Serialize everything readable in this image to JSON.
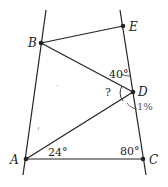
{
  "diagram": {
    "type": "geometry",
    "points": [
      {
        "name": "A",
        "x": 26,
        "y": 159
      },
      {
        "name": "B",
        "x": 41,
        "y": 43
      },
      {
        "name": "C",
        "x": 143,
        "y": 159
      },
      {
        "name": "D",
        "x": 133,
        "y": 92
      },
      {
        "name": "E",
        "x": 123,
        "y": 26
      }
    ],
    "lines": [
      {
        "name": "left-line",
        "from": [
          46,
          10
        ],
        "to": [
          23,
          175
        ]
      },
      {
        "name": "right-line",
        "from": [
          120,
          10
        ],
        "to": [
          146,
          175
        ]
      }
    ],
    "segments": [
      {
        "name": "BE",
        "from": "B",
        "to": "E"
      },
      {
        "name": "BD",
        "from": "B",
        "to": "D"
      },
      {
        "name": "AD",
        "from": "A",
        "to": "D"
      },
      {
        "name": "AC",
        "from": "A",
        "to": "C"
      }
    ],
    "angles": {
      "angle_A": "24°",
      "angle_C": "80°",
      "angle_D_upper": "40°",
      "angle_D_unknown": "?",
      "handwritten_mark": "1%"
    },
    "labels": {
      "A": "A",
      "B": "B",
      "C": "C",
      "D": "D",
      "E": "E"
    },
    "colors": {
      "line": "#222222",
      "background": "#ffffff",
      "handwriting": "#666666"
    }
  }
}
